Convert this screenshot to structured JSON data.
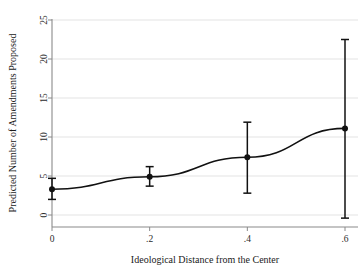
{
  "chart_data": {
    "type": "line",
    "title": "",
    "subtitle": "",
    "xlabel": "Ideological Distance from the Center",
    "ylabel": "Predicted Number of Amendments Proposed",
    "xlim": [
      -0.02,
      0.62
    ],
    "ylim": [
      -1.5,
      26
    ],
    "grid": true,
    "grid_axis": "y",
    "legend": "none",
    "x": [
      0,
      0.2,
      0.4,
      0.6
    ],
    "xtick_labels": [
      "0",
      ".2",
      ".4",
      ".6"
    ],
    "ytick_values": [
      0,
      5,
      10,
      15,
      20,
      25
    ],
    "ytick_labels": [
      "0",
      "5",
      "10",
      "15",
      "20",
      "25"
    ],
    "series": [
      {
        "name": "Predicted Number of Amendments Proposed",
        "values": [
          3.3,
          4.9,
          7.4,
          11.1
        ],
        "ci_lower": [
          2.0,
          3.7,
          2.8,
          -0.4
        ],
        "ci_upper": [
          4.7,
          6.2,
          11.9,
          22.5
        ],
        "marker": "filled-circle",
        "line_color": "#111111",
        "error_bar_color": "#111111"
      }
    ],
    "annotations": []
  },
  "axes": {
    "x_axis_label": "Ideological Distance from the Center",
    "y_axis_label": "Predicted Number of Amendments Proposed",
    "grid_color": "#dcdcdc",
    "axis_color": "#8a8a8a"
  },
  "figure": {
    "background_color": "#ffffff",
    "foreground_color": "#111111"
  }
}
